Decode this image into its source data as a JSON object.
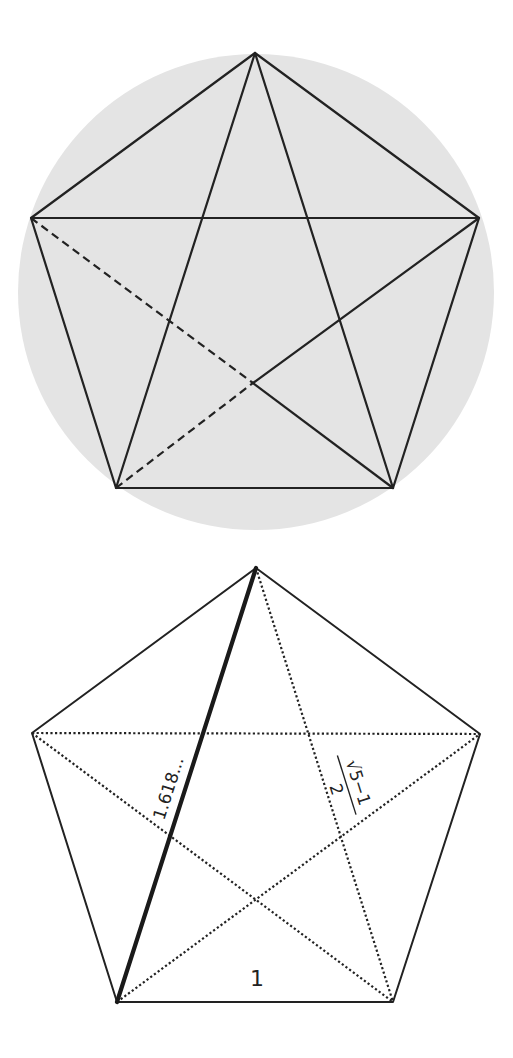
{
  "figure_top": {
    "description": "Regular pentagon inscribed in a shaded circle with all diagonals (pentagram); two diagonal segments dashed",
    "circle": {
      "cx": 256,
      "cy": 292,
      "r": 238,
      "fill": "#e4e4e4"
    },
    "line_color": "#222222",
    "vertices": {
      "top": [
        255,
        53
      ],
      "left": [
        31,
        218
      ],
      "right": [
        479,
        218
      ],
      "bottom_left": [
        116,
        488
      ],
      "bottom_right": [
        393,
        488
      ]
    },
    "dashed_intersection": [
      253,
      383
    ]
  },
  "figure_bottom": {
    "description": "Regular pentagon with solid edges, dotted diagonals, one bold diagonal with golden-ratio labels",
    "line_color": "#222222",
    "vertices": {
      "top": [
        256,
        568
      ],
      "left": [
        32,
        733
      ],
      "right": [
        480,
        734
      ],
      "bottom_left": [
        117,
        1002
      ],
      "bottom_right": [
        393,
        1002
      ]
    },
    "labels": {
      "bold_diagonal": "1.618...",
      "dotted_diagonal_numerator": "√5−1",
      "dotted_diagonal_denominator": "2",
      "side": "1"
    }
  }
}
